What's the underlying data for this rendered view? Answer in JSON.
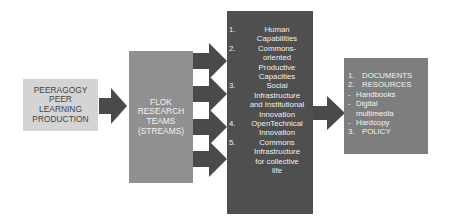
{
  "boxes": {
    "peeragogy": {
      "lines": [
        "PEERAGOGY",
        "PEER",
        "LEARNING",
        "PRODUCTION"
      ]
    },
    "flok": {
      "lines": [
        "FLOK",
        "RESEARCH",
        "TEAMS",
        "(STREAMS)"
      ]
    },
    "capacities": {
      "items": [
        {
          "num": "1.",
          "lines": [
            "Human",
            "Capabilities"
          ]
        },
        {
          "num": "2.",
          "lines": [
            "Commons-",
            "oriented",
            "Productive",
            "Capacities"
          ]
        },
        {
          "num": "3.",
          "lines": [
            "Social",
            "Infrastructure",
            "and Institutional",
            "Innovation"
          ]
        },
        {
          "num": "4.",
          "lines": [
            "OpenTechnical",
            "Innovation"
          ]
        },
        {
          "num": "5.",
          "lines": [
            "Commons",
            "Infrastructure",
            "for collective",
            "life"
          ]
        }
      ]
    },
    "outputs": {
      "lines": [
        {
          "prefix": "1.",
          "text": "DOCUMENTS"
        },
        {
          "prefix": "2.",
          "text": "RESOURCES"
        },
        {
          "prefix": "-",
          "text": "Handbooks"
        },
        {
          "prefix": "-",
          "text": "Digital"
        },
        {
          "prefix": "",
          "text": "multimedia"
        },
        {
          "prefix": "-",
          "text": "Hardcopy"
        },
        {
          "prefix": "3.",
          "text": "POLICY"
        }
      ]
    }
  },
  "colors": {
    "box1": "#d4d4d4",
    "box2": "#909090",
    "box3": "#4f4f4f",
    "box4": "#7e7e7e",
    "arrow": "#4a4a4a"
  }
}
